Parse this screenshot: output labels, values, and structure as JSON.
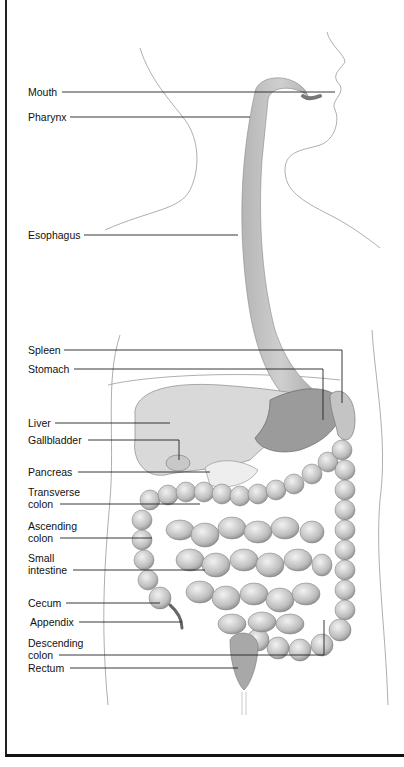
{
  "diagram": {
    "labels": [
      {
        "id": "mouth",
        "text": "Mouth",
        "x": 28,
        "y": 86
      },
      {
        "id": "pharynx",
        "text": "Pharynx",
        "x": 28,
        "y": 111
      },
      {
        "id": "esophagus",
        "text": "Esophagus",
        "x": 28,
        "y": 229
      },
      {
        "id": "spleen",
        "text": "Spleen",
        "x": 28,
        "y": 345
      },
      {
        "id": "stomach",
        "text": "Stomach",
        "x": 28,
        "y": 364
      },
      {
        "id": "liver",
        "text": "Liver",
        "x": 28,
        "y": 417
      },
      {
        "id": "gallbladder",
        "text": "Gallbladder",
        "x": 28,
        "y": 434
      },
      {
        "id": "pancreas",
        "text": "Pancreas",
        "x": 28,
        "y": 466
      },
      {
        "id": "transverse-colon",
        "text": "Transverse\ncolon",
        "x": 28,
        "y": 486
      },
      {
        "id": "ascending-colon",
        "text": "Ascending\ncolon",
        "x": 28,
        "y": 518
      },
      {
        "id": "small-intestine",
        "text": "Small\nintestine",
        "x": 28,
        "y": 552
      },
      {
        "id": "cecum",
        "text": "Cecum",
        "x": 28,
        "y": 597
      },
      {
        "id": "appendix",
        "text": "Appendix",
        "x": 30,
        "y": 616
      },
      {
        "id": "descending-colon",
        "text": "Descending\ncolon",
        "x": 28,
        "y": 636
      },
      {
        "id": "rectum",
        "text": "Rectum",
        "x": 28,
        "y": 663
      }
    ]
  }
}
